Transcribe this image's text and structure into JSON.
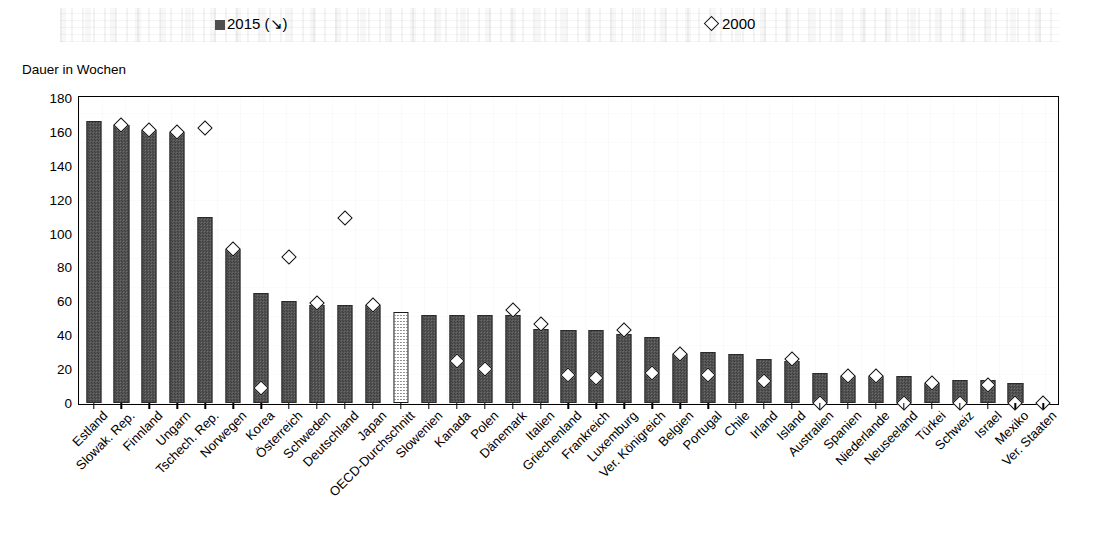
{
  "legend": {
    "series_2015_label": "2015 (↘)",
    "series_2000_label": "2000",
    "marker_2015": "filled-square",
    "marker_2000": "open-diamond"
  },
  "axis": {
    "y_title": "Dauer in Wochen",
    "y_ticks": [
      "0",
      "20",
      "40",
      "60",
      "80",
      "100",
      "120",
      "140",
      "160",
      "180"
    ]
  },
  "colors": {
    "bar_2015": "#4e4e4e",
    "bar_oecd_average": "#ffffff",
    "marker_2000": "#ffffff",
    "outline": "#000000"
  },
  "chart_data": {
    "type": "bar",
    "title": "",
    "subtitle": "",
    "xlabel": "",
    "ylabel": "Dauer in Wochen",
    "ylim": [
      0,
      180
    ],
    "ytick_step": 20,
    "grid": false,
    "legend_position": "top",
    "sort_note": "2015 (↘)",
    "highlight_category": "OECD-Durchschnitt",
    "categories": [
      "Estland",
      "Slowak. Rep.",
      "Finnland",
      "Ungarn",
      "Tschech. Rep.",
      "Norwegen",
      "Korea",
      "Österreich",
      "Schweden",
      "Deutschland",
      "Japan",
      "OECD-Durchschnitt",
      "Slowenien",
      "Kanada",
      "Polen",
      "Dänemark",
      "Italien",
      "Griechenland",
      "Frankreich",
      "Luxemburg",
      "Ver. Königreich",
      "Belgien",
      "Portugal",
      "Chile",
      "Irland",
      "Island",
      "Australien",
      "Spanien",
      "Niederlande",
      "Neuseeland",
      "Türkei",
      "Schweiz",
      "Israel",
      "Mexiko",
      "Ver. Staaten"
    ],
    "series": [
      {
        "name": "2015 (↘)",
        "type": "bar",
        "values": [
          166,
          164,
          161,
          160,
          110,
          91,
          65,
          60,
          58,
          58,
          58,
          54,
          52,
          52,
          52,
          52,
          44,
          43,
          43,
          41,
          39,
          29,
          30,
          29,
          26,
          25,
          18,
          16,
          16,
          16,
          12,
          14,
          14,
          12,
          0
        ]
      },
      {
        "name": "2000",
        "type": "scatter",
        "values": [
          null,
          164,
          161,
          160,
          162,
          91,
          9,
          86,
          59,
          109,
          58,
          null,
          null,
          25,
          20,
          55,
          47,
          17,
          15,
          43,
          18,
          29,
          17,
          null,
          13,
          26,
          0,
          16,
          16,
          0,
          12,
          0,
          11,
          0,
          0
        ]
      }
    ]
  }
}
